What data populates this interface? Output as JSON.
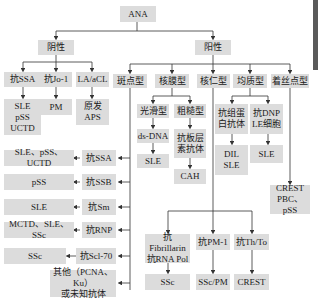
{
  "diagram": {
    "root": "ANA",
    "negative": {
      "label": "阴性",
      "children": [
        {
          "label": "抗SSA",
          "result": "SLE\npSS\nUCTD"
        },
        {
          "label": "抗Jo-1",
          "result": "PM"
        },
        {
          "label": "LA/aCL",
          "result": "原发\nAPS"
        }
      ]
    },
    "positive": {
      "label": "阳性",
      "patterns": [
        {
          "label": "斑点型"
        },
        {
          "label": "核膜型"
        },
        {
          "label": "核仁型"
        },
        {
          "label": "均质型"
        },
        {
          "label": "着丝点型"
        }
      ]
    },
    "speckled": [
      {
        "antibody": "抗SSA",
        "disease": "SLE、pSS、UCTD"
      },
      {
        "antibody": "抗SSB",
        "disease": "pSS"
      },
      {
        "antibody": "抗Sm",
        "disease": "SLE"
      },
      {
        "antibody": "抗RNP",
        "disease": "MCTD、SLE、SSc"
      },
      {
        "antibody": "抗Scl-70",
        "disease": "SSc"
      },
      {
        "antibody": "其他（PCNA、Ku）\n或未知抗体",
        "disease": ""
      }
    ],
    "membrane": {
      "smooth": {
        "label": "光滑型",
        "antibody": "ds-DNA",
        "disease": "SLE"
      },
      "rough": {
        "label": "粗糙型",
        "antibody": "抗板层\n素抗体",
        "disease": "CAH"
      }
    },
    "nucleolar": [
      {
        "antibody": "抗Fibrillarin\n抗RNA Pol",
        "disease": "SSc"
      },
      {
        "antibody": "抗PM-1",
        "disease": "SSc/PM"
      },
      {
        "antibody": "抗Th/To",
        "disease": "CREST"
      }
    ],
    "homogeneous": [
      {
        "antibody": "抗组蛋\n白抗体",
        "disease": "DIL\nSLE"
      },
      {
        "antibody": "抗DNP\nLE细胞",
        "disease": "SLE"
      }
    ],
    "centromere": {
      "disease": "CREST\nPBC、pSS"
    }
  }
}
